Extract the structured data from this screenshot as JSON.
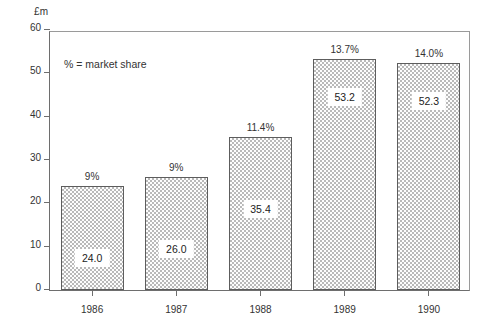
{
  "chart_data": {
    "type": "bar",
    "title": "",
    "subtitle": "",
    "xlabel": "",
    "ylabel": "£m",
    "ylim": [
      0,
      60
    ],
    "yticks": [
      0,
      10,
      20,
      30,
      40,
      50,
      60
    ],
    "ytick_labels": [
      "0",
      "10",
      "20",
      "30",
      "40",
      "50",
      "60"
    ],
    "grid": false,
    "legend": "none",
    "annotations": [
      "% = market share"
    ],
    "categories": [
      "1986",
      "1987",
      "1988",
      "1989",
      "1990"
    ],
    "values": [
      24.0,
      26.0,
      35.4,
      53.2,
      52.3
    ],
    "value_labels": [
      "24.0",
      "26.0",
      "35.4",
      "53.2",
      "52.3"
    ],
    "market_share_labels": [
      "9%",
      "9%",
      "11.4%",
      "13.7%",
      "14.0%"
    ],
    "series": [
      {
        "name": "Sales (£m)",
        "values": [
          24.0,
          26.0,
          35.4,
          53.2,
          52.3
        ]
      }
    ],
    "bar_fill": "#b9b9b9",
    "bar_edge": "#5d5d5d",
    "axis_color": "#6e6e6e",
    "text_color": "#333333",
    "background": "#ffffff"
  }
}
